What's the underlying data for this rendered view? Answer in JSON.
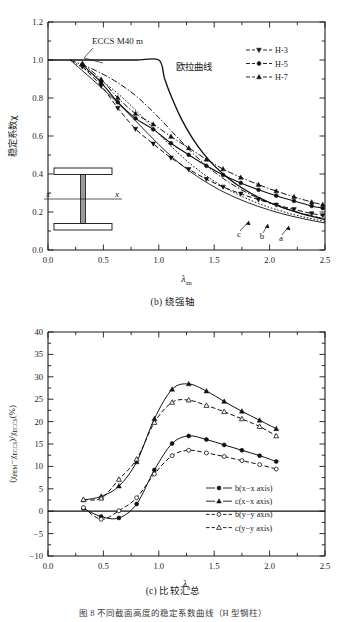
{
  "figure": {
    "bottom_caption": "图 8  不同截面高度的稳定系数曲线（H 型钢柱）"
  },
  "panel_b": {
    "caption": "(b) 绕强轴",
    "xlabel": "λ",
    "xlabel_sub": "xn",
    "ylabel": "稳定系数χ",
    "annotations": {
      "eccs": "ECCS M40 m",
      "euler": "欧拉曲线",
      "curve_a": "a",
      "curve_b": "b",
      "curve_c": "c",
      "inset_axis_left": "x",
      "inset_axis_right": "x"
    },
    "legend": [
      {
        "label": "H-3",
        "marker": "triangle-down"
      },
      {
        "label": "H-5",
        "marker": "circle"
      },
      {
        "label": "H-7",
        "marker": "triangle-up"
      }
    ],
    "xticks": [
      "0.0",
      "0.5",
      "1.0",
      "1.5",
      "2.0",
      "2.5"
    ],
    "yticks": [
      "0.0",
      "0.2",
      "0.4",
      "0.6",
      "0.8",
      "1.0",
      "1.2"
    ]
  },
  "panel_c": {
    "caption": "(c) 比较汇总",
    "xlabel": "λ",
    "xlabel_sub": "n",
    "ylabel_parts": {
      "open": "(χ",
      "sub1": "FEM",
      "minus": "−χ",
      "sub2": "ECCS",
      "close": ")/χ",
      "sub3": "ECCS",
      "unit": "(%)"
    },
    "legend": [
      {
        "label": "b(x−x axis)",
        "marker": "circle-filled"
      },
      {
        "label": "c(x−x axis)",
        "marker": "triangle-up-filled"
      },
      {
        "label": "b(y−y axis)",
        "marker": "circle-open"
      },
      {
        "label": "c(y−y axis)",
        "marker": "triangle-up-open"
      }
    ],
    "xticks": [
      "0.0",
      "0.5",
      "1.0",
      "1.5",
      "2.0",
      "2.5"
    ],
    "yticks": [
      "-10",
      "-5",
      "0",
      "5",
      "10",
      "15",
      "20",
      "25",
      "30",
      "35",
      "40"
    ]
  },
  "chart_data": [
    {
      "id": "panel_b",
      "type": "line",
      "title": "(b) 绕强轴",
      "xlabel": "λxn",
      "ylabel": "稳定系数χ",
      "xlim": [
        0.0,
        2.5
      ],
      "ylim": [
        0.0,
        1.2
      ],
      "grid": false,
      "legend_position": "top-right",
      "series": [
        {
          "name": "欧拉曲线",
          "style": "solid-thick",
          "markers": false,
          "x": [
            0.0,
            0.2,
            0.4,
            0.6,
            0.8,
            1.0,
            1.05,
            1.1,
            1.2,
            1.3,
            1.4,
            1.5,
            1.6,
            1.7,
            1.8,
            1.9,
            2.0,
            2.1,
            2.2,
            2.3,
            2.4,
            2.5
          ],
          "y": [
            1.0,
            1.0,
            1.0,
            1.0,
            1.0,
            1.0,
            0.907,
            0.826,
            0.694,
            0.592,
            0.51,
            0.444,
            0.391,
            0.346,
            0.309,
            0.277,
            0.25,
            0.227,
            0.207,
            0.189,
            0.174,
            0.16
          ]
        },
        {
          "name": "ECCS a",
          "style": "dash-dot",
          "markers": false,
          "x": [
            0.2,
            0.3,
            0.4,
            0.5,
            0.6,
            0.7,
            0.8,
            0.9,
            1.0,
            1.1,
            1.2,
            1.3,
            1.4,
            1.5,
            1.6,
            1.7,
            1.8,
            1.9,
            2.0,
            2.1,
            2.2,
            2.3,
            2.4,
            2.5
          ],
          "y": [
            1.0,
            0.977,
            0.953,
            0.924,
            0.891,
            0.853,
            0.808,
            0.755,
            0.697,
            0.635,
            0.573,
            0.513,
            0.459,
            0.411,
            0.369,
            0.332,
            0.3,
            0.272,
            0.248,
            0.227,
            0.208,
            0.192,
            0.177,
            0.164
          ]
        },
        {
          "name": "ECCS b",
          "style": "dotted",
          "markers": false,
          "x": [
            0.2,
            0.3,
            0.4,
            0.5,
            0.6,
            0.7,
            0.8,
            0.9,
            1.0,
            1.1,
            1.2,
            1.3,
            1.4,
            1.5,
            1.6,
            1.7,
            1.8,
            1.9,
            2.0,
            2.1,
            2.2,
            2.3,
            2.4,
            2.5
          ],
          "y": [
            1.0,
            0.964,
            0.926,
            0.884,
            0.838,
            0.787,
            0.731,
            0.672,
            0.611,
            0.552,
            0.497,
            0.447,
            0.402,
            0.362,
            0.327,
            0.296,
            0.269,
            0.245,
            0.224,
            0.206,
            0.189,
            0.175,
            0.162,
            0.15
          ]
        },
        {
          "name": "ECCS c",
          "style": "solid-thin",
          "markers": false,
          "x": [
            0.2,
            0.3,
            0.4,
            0.5,
            0.6,
            0.7,
            0.8,
            0.9,
            1.0,
            1.1,
            1.2,
            1.3,
            1.4,
            1.5,
            1.6,
            1.7,
            1.8,
            1.9,
            2.0,
            2.1,
            2.2,
            2.3,
            2.4,
            2.5
          ],
          "y": [
            1.0,
            0.949,
            0.898,
            0.845,
            0.791,
            0.733,
            0.674,
            0.614,
            0.555,
            0.5,
            0.45,
            0.406,
            0.367,
            0.332,
            0.301,
            0.274,
            0.25,
            0.229,
            0.21,
            0.193,
            0.178,
            0.165,
            0.153,
            0.142
          ]
        },
        {
          "name": "H-3",
          "marker": "triangle-down",
          "style": "dashed",
          "x": [
            0.31,
            0.48,
            0.63,
            0.79,
            0.95,
            1.11,
            1.27,
            1.43,
            1.58,
            1.74,
            1.9,
            2.06,
            2.22,
            2.38,
            2.48
          ],
          "y": [
            0.965,
            0.864,
            0.747,
            0.637,
            0.559,
            0.485,
            0.425,
            0.373,
            0.332,
            0.296,
            0.265,
            0.238,
            0.214,
            0.192,
            0.182
          ]
        },
        {
          "name": "H-5",
          "marker": "circle",
          "style": "solid-med",
          "x": [
            0.31,
            0.48,
            0.63,
            0.79,
            0.95,
            1.11,
            1.27,
            1.43,
            1.58,
            1.74,
            1.9,
            2.06,
            2.22,
            2.38,
            2.48
          ],
          "y": [
            0.975,
            0.881,
            0.778,
            0.693,
            0.635,
            0.562,
            0.501,
            0.443,
            0.395,
            0.353,
            0.317,
            0.286,
            0.258,
            0.232,
            0.22
          ]
        },
        {
          "name": "H-7",
          "marker": "triangle-up",
          "style": "dash-dot",
          "x": [
            0.31,
            0.48,
            0.63,
            0.79,
            0.95,
            1.11,
            1.27,
            1.43,
            1.58,
            1.74,
            1.9,
            2.06,
            2.22,
            2.38,
            2.48
          ],
          "y": [
            0.982,
            0.898,
            0.801,
            0.718,
            0.662,
            0.597,
            0.537,
            0.477,
            0.426,
            0.382,
            0.344,
            0.31,
            0.28,
            0.252,
            0.239
          ]
        }
      ]
    },
    {
      "id": "panel_c",
      "type": "line",
      "title": "(c) 比较汇总",
      "xlabel": "λn",
      "ylabel": "(χFEM−χECCS)/χECCS(%)",
      "xlim": [
        0.0,
        2.5
      ],
      "ylim": [
        -10,
        40
      ],
      "grid": false,
      "legend_position": "right-lower",
      "zero_line": true,
      "series": [
        {
          "name": "b(x−x axis)",
          "marker": "circle-filled",
          "style": "solid",
          "x": [
            0.32,
            0.48,
            0.64,
            0.8,
            0.96,
            1.12,
            1.27,
            1.43,
            1.59,
            1.75,
            1.91,
            2.06
          ],
          "y": [
            0.6,
            -1.2,
            -1.5,
            1.6,
            9.2,
            15.1,
            16.8,
            16.0,
            14.8,
            13.6,
            12.4,
            11.1
          ]
        },
        {
          "name": "c(x−x axis)",
          "marker": "triangle-up-filled",
          "style": "solid",
          "x": [
            0.32,
            0.48,
            0.64,
            0.8,
            0.96,
            1.12,
            1.27,
            1.43,
            1.59,
            1.75,
            1.91,
            2.06
          ],
          "y": [
            2.5,
            3.3,
            5.6,
            11.0,
            20.6,
            27.2,
            28.4,
            26.8,
            24.5,
            22.3,
            20.3,
            18.4
          ]
        },
        {
          "name": "b(y−y axis)",
          "marker": "circle-open",
          "style": "dashed",
          "x": [
            0.32,
            0.48,
            0.64,
            0.8,
            0.96,
            1.12,
            1.27,
            1.43,
            1.59,
            1.75,
            1.91,
            2.06
          ],
          "y": [
            0.8,
            -1.8,
            0.1,
            3.0,
            8.3,
            12.4,
            13.6,
            13.0,
            12.2,
            11.3,
            10.4,
            9.4
          ]
        },
        {
          "name": "c(y−y axis)",
          "marker": "triangle-up-open",
          "style": "dashed",
          "x": [
            0.32,
            0.48,
            0.64,
            0.8,
            0.96,
            1.12,
            1.27,
            1.43,
            1.59,
            1.75,
            1.91,
            2.06
          ],
          "y": [
            2.6,
            2.9,
            7.1,
            11.6,
            19.8,
            24.3,
            24.8,
            23.6,
            22.2,
            20.6,
            18.9,
            16.8
          ]
        }
      ]
    }
  ]
}
